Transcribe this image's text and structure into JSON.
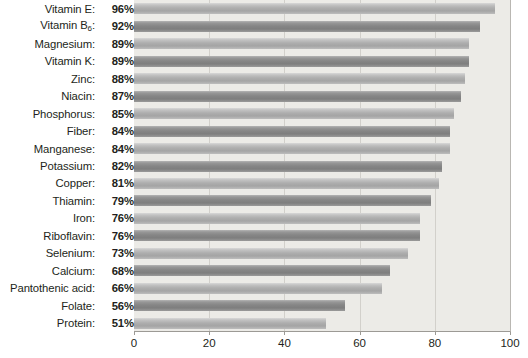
{
  "chart_data": {
    "type": "bar",
    "orientation": "horizontal",
    "title": "",
    "subtitle": "",
    "xlabel": "",
    "ylabel": "",
    "xlim": [
      0,
      100
    ],
    "xticks": [
      0,
      20,
      40,
      60,
      80,
      100
    ],
    "grid": true,
    "grid_axis": "x",
    "legend": "none",
    "categories": [
      "Vitamin E",
      "Vitamin B6",
      "Magnesium",
      "Vitamin K",
      "Zinc",
      "Niacin",
      "Phosphorus",
      "Fiber",
      "Manganese",
      "Potassium",
      "Copper",
      "Thiamin",
      "Iron",
      "Riboflavin",
      "Selenium",
      "Calcium",
      "Pantothenic acid",
      "Folate",
      "Protein"
    ],
    "values": [
      96,
      92,
      89,
      89,
      88,
      87,
      85,
      84,
      84,
      82,
      81,
      79,
      76,
      76,
      73,
      68,
      66,
      56,
      51
    ],
    "value_suffix": "%",
    "colors": {
      "bar_light": "#aeaeae",
      "bar_dark": "#868686",
      "plot_background": "#ecebe7",
      "gridline": "#d2d0cb",
      "axis": "#9c9a95",
      "text": "#231f20"
    }
  },
  "rows": [
    {
      "label": "Vitamin E:",
      "value": "96%",
      "subscript": ""
    },
    {
      "label": "Vitamin B",
      "value": "92%",
      "subscript": "6",
      "suffix": ":"
    },
    {
      "label": "Magnesium:",
      "value": "89%",
      "subscript": ""
    },
    {
      "label": "Vitamin K:",
      "value": "89%",
      "subscript": ""
    },
    {
      "label": "Zinc:",
      "value": "88%",
      "subscript": ""
    },
    {
      "label": "Niacin:",
      "value": "87%",
      "subscript": ""
    },
    {
      "label": "Phosphorus:",
      "value": "85%",
      "subscript": ""
    },
    {
      "label": "Fiber:",
      "value": "84%",
      "subscript": ""
    },
    {
      "label": "Manganese:",
      "value": "84%",
      "subscript": ""
    },
    {
      "label": "Potassium:",
      "value": "82%",
      "subscript": ""
    },
    {
      "label": "Copper:",
      "value": "81%",
      "subscript": ""
    },
    {
      "label": "Thiamin:",
      "value": "79%",
      "subscript": ""
    },
    {
      "label": "Iron:",
      "value": "76%",
      "subscript": ""
    },
    {
      "label": "Riboflavin:",
      "value": "76%",
      "subscript": ""
    },
    {
      "label": "Selenium:",
      "value": "73%",
      "subscript": ""
    },
    {
      "label": "Calcium:",
      "value": "68%",
      "subscript": ""
    },
    {
      "label": "Pantothenic acid:",
      "value": "66%",
      "subscript": ""
    },
    {
      "label": "Folate:",
      "value": "56%",
      "subscript": ""
    },
    {
      "label": "Protein:",
      "value": "51%",
      "subscript": ""
    }
  ],
  "axis": {
    "ticks": [
      "0",
      "20",
      "40",
      "60",
      "80",
      "100"
    ]
  }
}
